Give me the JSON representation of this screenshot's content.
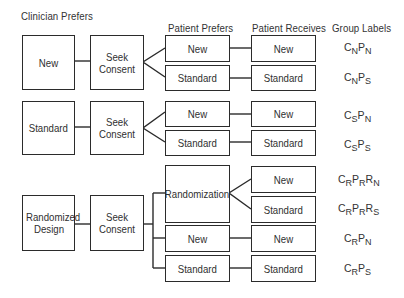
{
  "headers": {
    "clinician": "Clinician Prefers",
    "patient_prefers": "Patient Prefers",
    "patient_receives": "Patient Receives",
    "group_labels": "Group Labels"
  },
  "sections": [
    {
      "clinician": "New",
      "consent": "Seek Consent",
      "rows": [
        {
          "prefers": "New",
          "receives": "New",
          "group": [
            "C",
            "N",
            "P",
            "N"
          ]
        },
        {
          "prefers": "Standard",
          "receives": "Standard",
          "group": [
            "C",
            "N",
            "P",
            "S"
          ]
        }
      ]
    },
    {
      "clinician": "Standard",
      "consent": "Seek Consent",
      "rows": [
        {
          "prefers": "New",
          "receives": "New",
          "group": [
            "C",
            "S",
            "P",
            "N"
          ]
        },
        {
          "prefers": "Standard",
          "receives": "Standard",
          "group": [
            "C",
            "S",
            "P",
            "S"
          ]
        }
      ]
    },
    {
      "clinician": "Randomized Design",
      "consent": "Seek Consent",
      "randomization": "Randomization",
      "rows": [
        {
          "prefers": "Randomization",
          "receives": "New",
          "group": [
            "C",
            "R",
            "P",
            "R",
            "R",
            "N"
          ]
        },
        {
          "prefers": "Randomization",
          "receives": "Standard",
          "group": [
            "C",
            "R",
            "P",
            "R",
            "R",
            "S"
          ]
        },
        {
          "prefers": "New",
          "receives": "New",
          "group": [
            "C",
            "R",
            "P",
            "N"
          ]
        },
        {
          "prefers": "Standard",
          "receives": "Standard",
          "group": [
            "C",
            "R",
            "P",
            "S"
          ]
        }
      ]
    }
  ]
}
